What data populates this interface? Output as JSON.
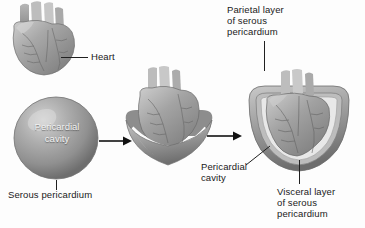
{
  "figure": {
    "background_color": "#fdfdfd",
    "text_color": "#1a1a1a",
    "organ_tone": "#9a9a9a"
  },
  "labels": {
    "heart": "Heart",
    "pericardial_cavity_sphere": "Pericardial\ncavity",
    "serous_pericardium": "Serous pericardium",
    "parietal_layer": "Parietal layer\nof serous\npericardium",
    "pericardial_cavity_final": "Pericardial\ncavity",
    "visceral_layer": "Visceral layer\nof serous\npericardium"
  },
  "stages": [
    {
      "name": "heart-alone",
      "caption": "Heart"
    },
    {
      "name": "serous-sac",
      "caption": "Serous pericardium enclosing pericardial cavity"
    },
    {
      "name": "heart-invaginating-sac",
      "caption": "Heart pushing into serous sac"
    },
    {
      "name": "heart-enclosed",
      "caption": "Heart enclosed by parietal and visceral layers"
    }
  ],
  "arrows": [
    {
      "name": "arrow-1",
      "direction": "right"
    },
    {
      "name": "arrow-2",
      "direction": "right"
    }
  ]
}
